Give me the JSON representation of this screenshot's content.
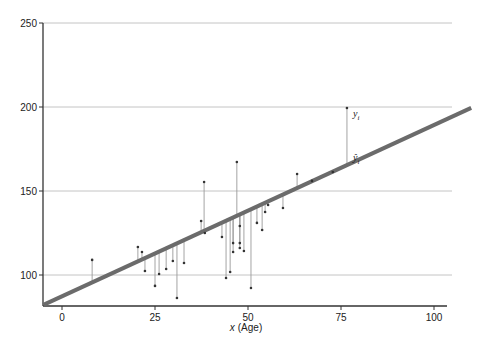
{
  "chart_data": {
    "type": "scatter",
    "title": "",
    "xlabel_var": "x",
    "xlabel": "(Age)",
    "ylabel": "",
    "xlim": [
      -5,
      110
    ],
    "ylim": [
      81.5,
      250
    ],
    "grid": {
      "horizontal": true,
      "vertical": false
    },
    "x_ticks": [
      0,
      25,
      50,
      75,
      100
    ],
    "y_ticks": [
      100,
      150,
      200,
      250
    ],
    "x_tick_labels": [
      "0",
      "25",
      "50",
      "75",
      "100"
    ],
    "y_tick_labels": [
      "100",
      "150",
      "200",
      "250"
    ],
    "regression_line": {
      "intercept": 87.3,
      "slope": 1.02,
      "x_start": -5,
      "x_end": 110
    },
    "points": [
      {
        "x": 8.1,
        "y": 109.0
      },
      {
        "x": 20.4,
        "y": 116.7
      },
      {
        "x": 21.5,
        "y": 113.7
      },
      {
        "x": 22.3,
        "y": 102.4
      },
      {
        "x": 25.0,
        "y": 93.5
      },
      {
        "x": 26.1,
        "y": 100.6
      },
      {
        "x": 28.0,
        "y": 103.6
      },
      {
        "x": 29.8,
        "y": 108.3
      },
      {
        "x": 30.9,
        "y": 86.3
      },
      {
        "x": 32.8,
        "y": 107.1
      },
      {
        "x": 37.4,
        "y": 132.1
      },
      {
        "x": 38.2,
        "y": 155.4
      },
      {
        "x": 38.4,
        "y": 125.0
      },
      {
        "x": 43.0,
        "y": 122.6
      },
      {
        "x": 44.1,
        "y": 98.2
      },
      {
        "x": 45.2,
        "y": 101.8
      },
      {
        "x": 46.0,
        "y": 119.0
      },
      {
        "x": 46.0,
        "y": 113.7
      },
      {
        "x": 47.0,
        "y": 167.3
      },
      {
        "x": 47.8,
        "y": 129.2
      },
      {
        "x": 47.8,
        "y": 119.0
      },
      {
        "x": 47.8,
        "y": 116.1
      },
      {
        "x": 48.9,
        "y": 114.3
      },
      {
        "x": 50.8,
        "y": 92.3
      },
      {
        "x": 52.4,
        "y": 131.0
      },
      {
        "x": 53.8,
        "y": 126.8
      },
      {
        "x": 54.6,
        "y": 137.5
      },
      {
        "x": 55.4,
        "y": 141.7
      },
      {
        "x": 59.4,
        "y": 139.9
      },
      {
        "x": 63.2,
        "y": 160.1
      },
      {
        "x": 67.2,
        "y": 156.0
      },
      {
        "x": 72.8,
        "y": 161.3
      },
      {
        "x": 76.6,
        "y": 199.4
      }
    ],
    "highlighted_point_index": 32,
    "annotations": [
      {
        "text": "y",
        "subscript": "i",
        "target": "observed"
      },
      {
        "text": "ŷ",
        "subscript": "i",
        "target": "fitted"
      }
    ],
    "colors": {
      "regression_line": "#6b6b6b",
      "residual_lines": "#9a9a9a",
      "points": "#333333",
      "grid": "#c4c4c4",
      "axis": "#333333"
    }
  }
}
